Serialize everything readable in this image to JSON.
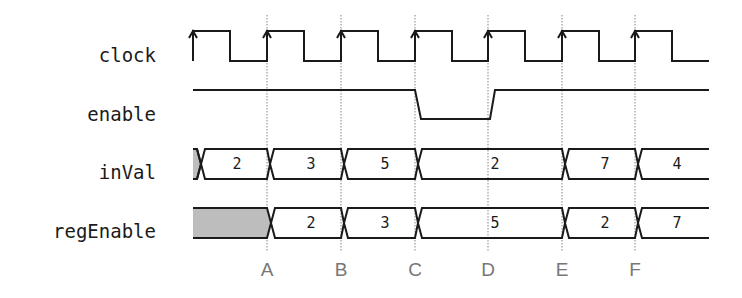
{
  "diagram": {
    "type": "timing-diagram",
    "colors": {
      "wave": "#1a1a1a",
      "grid": "#9a9a9a",
      "marker": "#777777",
      "undefined_fill": "#bdbdbd"
    },
    "signals": [
      {
        "name": "clock",
        "label": "clock",
        "kind": "clock"
      },
      {
        "name": "enable",
        "label": "enable",
        "kind": "digital",
        "low_interval": [
          "C",
          "D"
        ]
      },
      {
        "name": "inVal",
        "label": "inVal",
        "kind": "bus",
        "segments": [
          {
            "value": "",
            "undefined": true
          },
          {
            "value": "2"
          },
          {
            "value": "3"
          },
          {
            "value": "5"
          },
          {
            "value": "2"
          },
          {
            "value": "7"
          },
          {
            "value": "4"
          }
        ]
      },
      {
        "name": "regEnable",
        "label": "regEnable",
        "kind": "bus",
        "segments": [
          {
            "value": "",
            "undefined": true
          },
          {
            "value": "2"
          },
          {
            "value": "3"
          },
          {
            "value": "5"
          },
          {
            "value": "2"
          },
          {
            "value": "7"
          }
        ]
      }
    ],
    "markers": [
      "A",
      "B",
      "C",
      "D",
      "E",
      "F"
    ]
  }
}
